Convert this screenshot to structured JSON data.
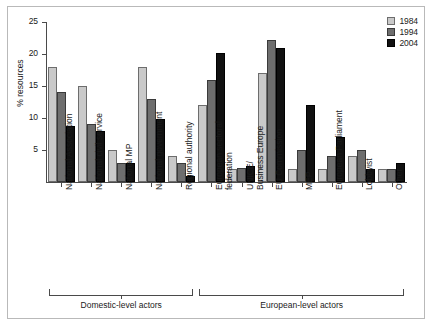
{
  "chart_data": {
    "type": "bar",
    "title": "",
    "xlabel": "",
    "ylabel": "% resources",
    "ylim": [
      0,
      25
    ],
    "yticks": [
      0,
      5,
      10,
      15,
      20,
      25
    ],
    "ytick_labels": [
      "0",
      "5",
      "10",
      "15",
      "20",
      "25"
    ],
    "grid": false,
    "legend_position": "top-right",
    "categories": [
      "National Association",
      "National civil service",
      "National MP",
      "National government",
      "Regional authority",
      "European sectoral\nfederation",
      "UNICE/\nBusiness Europe",
      "EU Commission",
      "MEP",
      "European Parliament",
      "Lobbyist",
      "Other"
    ],
    "series": [
      {
        "name": "1984",
        "color": "#c9c9c9",
        "values": [
          18,
          15,
          5,
          18,
          4,
          12,
          2,
          17,
          2,
          2,
          4,
          2
        ]
      },
      {
        "name": "1994",
        "color": "#6e6e6e",
        "values": [
          14,
          9,
          3,
          13,
          3,
          16,
          2.2,
          22.2,
          5,
          4,
          5,
          2
        ]
      },
      {
        "name": "2004",
        "color": "#111111",
        "values": [
          8.8,
          7.9,
          3,
          9.8,
          1,
          20.1,
          2.5,
          21,
          12,
          7,
          2,
          3
        ]
      }
    ],
    "group_brackets": [
      {
        "label": "Domestic-level actors",
        "from_category": 0,
        "to_category": 4
      },
      {
        "label": "European-level actors",
        "from_category": 5,
        "to_category": 11
      }
    ]
  }
}
